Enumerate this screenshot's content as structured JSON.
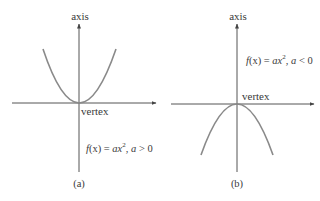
{
  "figure": {
    "panels": [
      {
        "id": "a",
        "caption": "(a)",
        "axis_label": "axis",
        "vertex_label": "vertex",
        "formula": {
          "lhs_fn": "f",
          "lhs_var": "(x)",
          "eq": " = ",
          "coef": "a",
          "var": "x",
          "exp": "2",
          "sep": ", ",
          "cond_var": "a",
          "cond_op": " > ",
          "cond_val": "0",
          "full_text": "f(x) = ax², a > 0"
        },
        "opens": "up"
      },
      {
        "id": "b",
        "caption": "(b)",
        "axis_label": "axis",
        "vertex_label": "vertex",
        "formula": {
          "lhs_fn": "f",
          "lhs_var": "(x)",
          "eq": " = ",
          "coef": "a",
          "var": "x",
          "exp": "2",
          "sep": ", ",
          "cond_var": "a",
          "cond_op": " < ",
          "cond_val": "0",
          "full_text": "f(x) = ax², a < 0"
        },
        "opens": "down"
      }
    ],
    "colors": {
      "axis": "#555555",
      "curve": "#8a8a8a",
      "text": "#3a3a3a",
      "background": "#ffffff"
    }
  }
}
